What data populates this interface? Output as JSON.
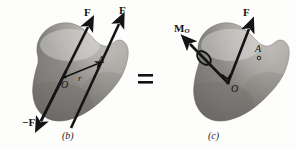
{
  "figure": {
    "background_color": "#fdfdfc",
    "ink_color": "#141414",
    "body_fill_light": "#d8d6d2",
    "body_fill_mid": "#b9b6b1",
    "body_fill_dark": "#7e7b77",
    "equals_symbol": "="
  },
  "panel_b": {
    "caption": "(b)",
    "labels": {
      "force_top_left": "F",
      "force_top_right": "F",
      "force_negative": "−F",
      "origin": "O",
      "position_vector": "r",
      "point_a": "A"
    }
  },
  "panel_c": {
    "caption": "(c)",
    "labels": {
      "force": "F",
      "moment": "M",
      "moment_subscript": "O",
      "origin": "O",
      "point_a": "A"
    }
  }
}
